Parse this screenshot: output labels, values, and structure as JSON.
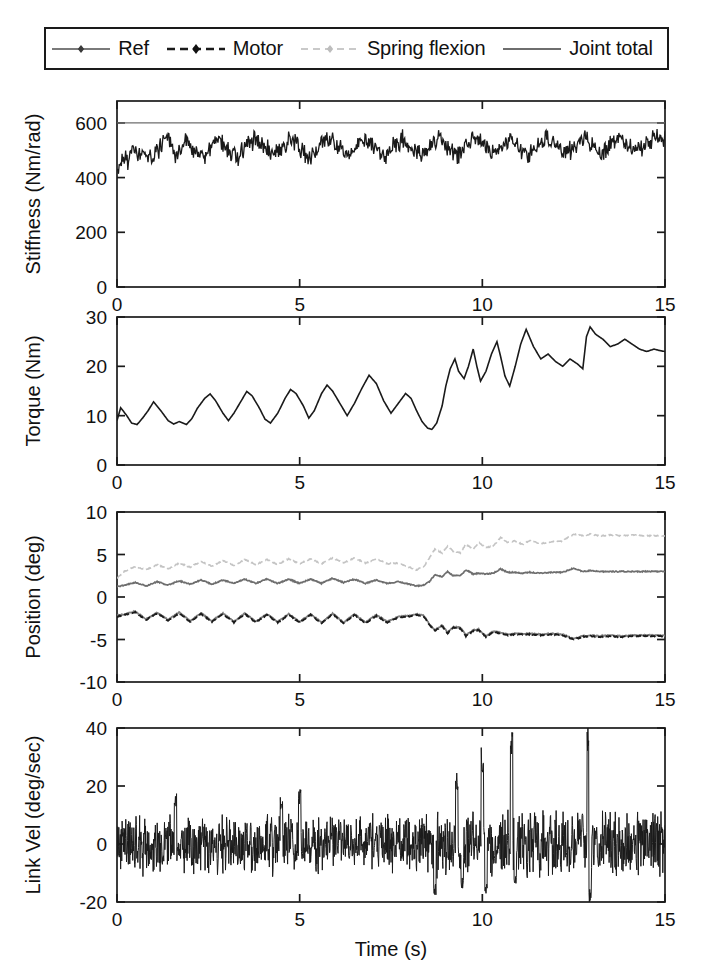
{
  "legend": {
    "position": "top",
    "entries": [
      {
        "label": "Ref",
        "style": "solid-marker",
        "color": "#7a7a7a"
      },
      {
        "label": "Motor",
        "style": "dashed-marker",
        "color": "#1a1a1a"
      },
      {
        "label": "Spring flexion",
        "style": "dashed-marker",
        "color": "#c2c2c2"
      },
      {
        "label": "Joint total",
        "style": "solid",
        "color": "#6e6e6e"
      }
    ]
  },
  "axes": {
    "xlabel": "Time (s)",
    "xlim": [
      0,
      15
    ],
    "xticks": [
      0,
      5,
      10,
      15
    ],
    "xticklabels": [
      "0",
      "5",
      "10",
      "15"
    ]
  },
  "chart_data": [
    {
      "type": "line",
      "panel": 1,
      "title": "",
      "xlabel": "",
      "ylabel": "Stiffness (Nm/rad)",
      "xlim": [
        0,
        15
      ],
      "ylim": [
        0,
        680
      ],
      "yticks": [
        0,
        200,
        400,
        600
      ],
      "yticklabels": [
        "0",
        "200",
        "400",
        "600"
      ],
      "grid": false,
      "series": [
        {
          "name": "Ref",
          "color": "#6e6e6e",
          "style": "solid",
          "width": 1.4,
          "x": [
            0,
            15
          ],
          "values": [
            600,
            600
          ]
        },
        {
          "name": "Motor",
          "color": "#1a1a1a",
          "style": "noisy",
          "width": 1.3,
          "noise": 28,
          "samples": 760,
          "x": [
            0.0,
            0.15,
            0.3,
            0.5,
            0.75,
            1.0,
            1.2,
            1.45,
            1.6,
            1.85,
            2.1,
            2.35,
            2.6,
            2.85,
            3.05,
            3.3,
            3.55,
            3.8,
            4.05,
            4.3,
            4.55,
            4.8,
            5.05,
            5.3,
            5.55,
            5.8,
            6.05,
            6.3,
            6.55,
            6.8,
            7.05,
            7.3,
            7.55,
            7.8,
            8.05,
            8.3,
            8.55,
            8.8,
            9.05,
            9.3,
            9.55,
            9.8,
            10.05,
            10.3,
            10.55,
            10.8,
            11.05,
            11.3,
            11.55,
            11.8,
            12.05,
            12.3,
            12.55,
            12.8,
            13.05,
            13.3,
            13.55,
            13.8,
            14.05,
            14.3,
            14.55,
            14.8,
            15.0
          ],
          "values": [
            410,
            470,
            455,
            500,
            480,
            465,
            520,
            540,
            470,
            540,
            500,
            480,
            505,
            545,
            500,
            470,
            520,
            545,
            505,
            480,
            520,
            540,
            500,
            470,
            515,
            545,
            510,
            480,
            520,
            545,
            505,
            475,
            515,
            540,
            505,
            485,
            520,
            545,
            510,
            480,
            520,
            550,
            515,
            480,
            520,
            545,
            505,
            485,
            525,
            545,
            510,
            480,
            520,
            550,
            515,
            490,
            525,
            545,
            515,
            495,
            530,
            545,
            540
          ]
        }
      ]
    },
    {
      "type": "line",
      "panel": 2,
      "title": "",
      "xlabel": "",
      "ylabel": "Torque (Nm)",
      "xlim": [
        0,
        15
      ],
      "ylim": [
        0,
        30
      ],
      "yticks": [
        0,
        10,
        20,
        30
      ],
      "yticklabels": [
        "0",
        "10",
        "20",
        "30"
      ],
      "grid": false,
      "series": [
        {
          "name": "Motor",
          "color": "#1a1a1a",
          "style": "solid",
          "width": 1.6,
          "x": [
            0.0,
            0.1,
            0.25,
            0.4,
            0.55,
            0.7,
            0.85,
            1.0,
            1.2,
            1.4,
            1.55,
            1.7,
            1.9,
            2.05,
            2.2,
            2.4,
            2.55,
            2.7,
            2.9,
            3.05,
            3.2,
            3.4,
            3.55,
            3.7,
            3.9,
            4.05,
            4.2,
            4.4,
            4.6,
            4.75,
            4.9,
            5.1,
            5.25,
            5.4,
            5.6,
            5.75,
            5.9,
            6.1,
            6.3,
            6.5,
            6.7,
            6.9,
            7.1,
            7.3,
            7.5,
            7.7,
            7.9,
            8.05,
            8.2,
            8.35,
            8.5,
            8.62,
            8.75,
            8.9,
            9.0,
            9.12,
            9.25,
            9.35,
            9.5,
            9.62,
            9.75,
            9.85,
            9.95,
            10.1,
            10.25,
            10.4,
            10.5,
            10.62,
            10.75,
            10.9,
            11.05,
            11.2,
            11.4,
            11.6,
            11.8,
            12.0,
            12.2,
            12.4,
            12.6,
            12.75,
            12.85,
            12.95,
            13.1,
            13.3,
            13.5,
            13.7,
            13.9,
            14.1,
            14.3,
            14.5,
            14.7,
            14.85,
            15.0
          ],
          "values": [
            9.0,
            11.6,
            10.2,
            8.5,
            8.2,
            9.5,
            11.0,
            12.8,
            11.0,
            9.0,
            8.3,
            8.8,
            8.2,
            9.4,
            11.5,
            13.5,
            14.4,
            13.0,
            10.5,
            9.0,
            10.5,
            13.0,
            14.9,
            14.0,
            11.5,
            9.3,
            8.5,
            10.5,
            13.5,
            15.3,
            14.5,
            12.0,
            9.5,
            11.0,
            14.5,
            16.2,
            15.0,
            12.5,
            10.0,
            12.5,
            15.5,
            18.2,
            16.5,
            13.0,
            10.5,
            12.5,
            14.5,
            13.5,
            11.0,
            8.8,
            7.5,
            7.2,
            8.5,
            12.0,
            16.0,
            19.5,
            21.5,
            19.0,
            17.5,
            20.0,
            23.5,
            20.0,
            17.0,
            19.0,
            22.5,
            25.0,
            22.0,
            18.0,
            16.0,
            20.0,
            24.5,
            27.5,
            24.0,
            21.5,
            22.5,
            21.0,
            20.0,
            21.5,
            20.5,
            19.5,
            26.0,
            28.0,
            26.5,
            25.5,
            24.0,
            24.5,
            25.5,
            24.5,
            23.5,
            23.0,
            23.5,
            23.2,
            23.0
          ]
        }
      ]
    },
    {
      "type": "line",
      "panel": 3,
      "title": "",
      "xlabel": "",
      "ylabel": "Position (deg)",
      "xlim": [
        0,
        15
      ],
      "ylim": [
        -10,
        10
      ],
      "yticks": [
        -10,
        -5,
        0,
        5,
        10
      ],
      "yticklabels": [
        "-10",
        "-5",
        "0",
        "5",
        "10"
      ],
      "grid": false,
      "series": [
        {
          "name": "Spring flexion",
          "color": "#c4c4c4",
          "style": "dashed",
          "width": 1.6,
          "x": [
            0.0,
            0.2,
            0.5,
            0.8,
            1.1,
            1.4,
            1.7,
            2.0,
            2.3,
            2.6,
            2.9,
            3.2,
            3.5,
            3.8,
            4.1,
            4.4,
            4.7,
            5.0,
            5.3,
            5.6,
            5.9,
            6.2,
            6.5,
            6.8,
            7.1,
            7.4,
            7.7,
            8.0,
            8.2,
            8.4,
            8.55,
            8.7,
            8.9,
            9.05,
            9.2,
            9.4,
            9.55,
            9.75,
            9.9,
            10.1,
            10.3,
            10.5,
            10.7,
            10.9,
            11.1,
            11.3,
            11.6,
            11.9,
            12.2,
            12.5,
            12.75,
            12.95,
            13.2,
            13.5,
            13.8,
            14.1,
            14.4,
            14.7,
            15.0
          ],
          "values": [
            2.2,
            3.0,
            3.6,
            3.2,
            3.8,
            3.3,
            4.0,
            3.5,
            4.2,
            3.6,
            4.3,
            3.7,
            4.4,
            3.8,
            4.4,
            3.8,
            4.5,
            3.9,
            4.5,
            3.9,
            4.6,
            4.0,
            4.6,
            4.0,
            4.5,
            3.9,
            4.0,
            3.5,
            3.2,
            3.6,
            4.6,
            5.6,
            5.2,
            6.0,
            5.4,
            5.2,
            6.2,
            5.6,
            6.4,
            5.8,
            6.0,
            7.0,
            6.4,
            6.6,
            6.2,
            6.6,
            6.3,
            6.5,
            6.6,
            7.4,
            7.2,
            7.4,
            7.2,
            7.3,
            7.2,
            7.3,
            7.2,
            7.2,
            7.2
          ]
        },
        {
          "name": "Joint total",
          "color": "#6e6e6e",
          "style": "solid",
          "width": 1.7,
          "x": [
            0.0,
            0.2,
            0.5,
            0.8,
            1.1,
            1.4,
            1.7,
            2.0,
            2.3,
            2.6,
            2.9,
            3.2,
            3.5,
            3.8,
            4.1,
            4.4,
            4.7,
            5.0,
            5.3,
            5.6,
            5.9,
            6.2,
            6.5,
            6.8,
            7.1,
            7.4,
            7.7,
            8.0,
            8.2,
            8.4,
            8.55,
            8.7,
            8.9,
            9.05,
            9.2,
            9.4,
            9.55,
            9.75,
            9.9,
            10.1,
            10.3,
            10.5,
            10.7,
            10.9,
            11.1,
            11.3,
            11.6,
            11.9,
            12.2,
            12.5,
            12.75,
            12.95,
            13.2,
            13.5,
            13.8,
            14.1,
            14.4,
            14.7,
            15.0
          ],
          "values": [
            1.2,
            1.4,
            1.7,
            1.3,
            1.8,
            1.4,
            1.9,
            1.5,
            2.0,
            1.5,
            2.0,
            1.6,
            2.1,
            1.6,
            2.1,
            1.6,
            2.1,
            1.6,
            2.1,
            1.6,
            2.2,
            1.7,
            2.1,
            1.6,
            2.0,
            1.6,
            1.8,
            1.5,
            1.3,
            1.4,
            1.8,
            2.6,
            2.4,
            3.0,
            2.5,
            2.5,
            3.2,
            2.7,
            2.8,
            2.7,
            2.8,
            3.3,
            2.9,
            2.9,
            2.8,
            2.9,
            2.8,
            2.9,
            2.9,
            3.4,
            3.0,
            3.1,
            3.0,
            3.0,
            3.0,
            3.0,
            3.0,
            3.0,
            3.0
          ]
        },
        {
          "name": "Ref",
          "color": "#808080",
          "style": "solid",
          "width": 1.8,
          "x": [
            0.0,
            0.2,
            0.5,
            0.8,
            1.1,
            1.4,
            1.7,
            2.0,
            2.3,
            2.6,
            2.9,
            3.2,
            3.5,
            3.8,
            4.1,
            4.4,
            4.7,
            5.0,
            5.3,
            5.6,
            5.9,
            6.2,
            6.5,
            6.8,
            7.1,
            7.4,
            7.7,
            8.0,
            8.2,
            8.4,
            8.55,
            8.7,
            8.9,
            9.05,
            9.2,
            9.4,
            9.55,
            9.75,
            9.9,
            10.1,
            10.3,
            10.5,
            10.7,
            10.9,
            11.1,
            11.3,
            11.6,
            11.9,
            12.2,
            12.5,
            12.75,
            12.95,
            13.2,
            13.5,
            13.8,
            14.1,
            14.4,
            14.7,
            15.0
          ],
          "values": [
            -2.2,
            -2.0,
            -1.7,
            -2.6,
            -1.8,
            -2.7,
            -1.8,
            -2.8,
            -1.9,
            -2.8,
            -1.9,
            -2.9,
            -1.9,
            -2.9,
            -2.0,
            -2.9,
            -2.0,
            -2.9,
            -2.0,
            -3.0,
            -1.9,
            -3.0,
            -2.0,
            -3.0,
            -2.1,
            -2.9,
            -2.3,
            -2.2,
            -2.0,
            -2.2,
            -3.2,
            -3.9,
            -3.3,
            -4.2,
            -3.5,
            -3.6,
            -4.5,
            -3.9,
            -3.8,
            -4.6,
            -4.0,
            -4.2,
            -4.4,
            -4.3,
            -4.3,
            -4.3,
            -4.4,
            -4.3,
            -4.4,
            -4.9,
            -4.6,
            -4.5,
            -4.6,
            -4.5,
            -4.6,
            -4.5,
            -4.5,
            -4.5,
            -4.5
          ]
        },
        {
          "name": "Motor",
          "color": "#1a1a1a",
          "style": "dashed",
          "width": 1.8,
          "x": [
            0.0,
            0.2,
            0.5,
            0.8,
            1.1,
            1.4,
            1.7,
            2.0,
            2.3,
            2.6,
            2.9,
            3.2,
            3.5,
            3.8,
            4.1,
            4.4,
            4.7,
            5.0,
            5.3,
            5.6,
            5.9,
            6.2,
            6.5,
            6.8,
            7.1,
            7.4,
            7.7,
            8.0,
            8.2,
            8.4,
            8.55,
            8.7,
            8.9,
            9.05,
            9.2,
            9.4,
            9.55,
            9.75,
            9.9,
            10.1,
            10.3,
            10.5,
            10.7,
            10.9,
            11.1,
            11.3,
            11.6,
            11.9,
            12.2,
            12.5,
            12.75,
            12.95,
            13.2,
            13.5,
            13.8,
            14.1,
            14.4,
            14.7,
            15.0
          ],
          "values": [
            -2.3,
            -2.1,
            -1.8,
            -2.7,
            -1.9,
            -2.8,
            -1.9,
            -2.9,
            -2.0,
            -2.9,
            -2.0,
            -3.0,
            -2.0,
            -3.0,
            -2.1,
            -3.0,
            -2.1,
            -3.0,
            -2.1,
            -3.1,
            -2.0,
            -3.1,
            -2.1,
            -3.1,
            -2.2,
            -3.0,
            -2.4,
            -2.3,
            -2.1,
            -2.3,
            -3.3,
            -4.0,
            -3.4,
            -4.3,
            -3.6,
            -3.7,
            -4.6,
            -4.0,
            -3.9,
            -4.7,
            -4.1,
            -4.3,
            -4.5,
            -4.4,
            -4.4,
            -4.4,
            -4.5,
            -4.4,
            -4.5,
            -5.0,
            -4.7,
            -4.6,
            -4.7,
            -4.6,
            -4.7,
            -4.6,
            -4.6,
            -4.6,
            -4.6
          ]
        }
      ]
    },
    {
      "type": "line",
      "panel": 4,
      "title": "",
      "xlabel": "Time (s)",
      "ylabel": "Link Vel (deg/sec)",
      "xlim": [
        0,
        15
      ],
      "ylim": [
        -20,
        40
      ],
      "yticks": [
        -20,
        0,
        20,
        40
      ],
      "yticklabels": [
        "-20",
        "0",
        "20",
        "40"
      ],
      "grid": false,
      "series": [
        {
          "name": "Link velocity",
          "color": "#1a1a1a",
          "style": "noise-band",
          "width": 1.0,
          "samples": 1500,
          "band": 9,
          "baseline": 0,
          "spikes": [
            {
              "x": 9.3,
              "y": 24
            },
            {
              "x": 9.45,
              "y": -15
            },
            {
              "x": 10.0,
              "y": 32
            },
            {
              "x": 10.1,
              "y": -17
            },
            {
              "x": 10.8,
              "y": 38
            },
            {
              "x": 10.9,
              "y": -14
            },
            {
              "x": 12.9,
              "y": 40
            },
            {
              "x": 12.95,
              "y": -20
            },
            {
              "x": 8.7,
              "y": -18
            },
            {
              "x": 1.6,
              "y": 17
            },
            {
              "x": 4.5,
              "y": 16
            },
            {
              "x": 5.0,
              "y": 18
            }
          ]
        }
      ]
    }
  ]
}
